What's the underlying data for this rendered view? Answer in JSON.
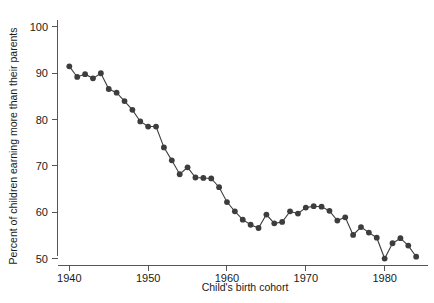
{
  "chart_data": {
    "type": "line",
    "title": "",
    "xlabel": "Child's birth cohort",
    "ylabel": "Percent of children earning more than their parents",
    "xlim": [
      1938.5,
      1985.5
    ],
    "ylim": [
      48.5,
      101.5
    ],
    "xticks": [
      1940,
      1950,
      1960,
      1970,
      1980
    ],
    "yticks": [
      50,
      60,
      70,
      80,
      90,
      100
    ],
    "xtick_labels": [
      "1940",
      "1950",
      "1960",
      "1970",
      "1980"
    ],
    "ytick_labels": [
      "50",
      "60",
      "70",
      "80",
      "90",
      "100"
    ],
    "grid": false,
    "legend": "none",
    "marker": "circle",
    "marker_color": "#3d3d3d",
    "line_color": "#3d3d3d",
    "x": [
      1940,
      1941,
      1942,
      1943,
      1944,
      1945,
      1946,
      1947,
      1948,
      1949,
      1950,
      1951,
      1952,
      1953,
      1954,
      1955,
      1956,
      1957,
      1958,
      1959,
      1960,
      1961,
      1962,
      1963,
      1964,
      1965,
      1966,
      1967,
      1968,
      1969,
      1970,
      1971,
      1972,
      1973,
      1974,
      1975,
      1976,
      1977,
      1978,
      1979,
      1980,
      1981,
      1982,
      1983,
      1984
    ],
    "values": [
      91.5,
      89.2,
      89.8,
      88.9,
      90.0,
      86.6,
      85.8,
      84.0,
      82.1,
      79.6,
      78.5,
      78.5,
      74.0,
      71.2,
      68.2,
      69.7,
      67.5,
      67.4,
      67.3,
      65.4,
      62.2,
      60.2,
      58.4,
      57.3,
      56.6,
      59.5,
      57.6,
      57.9,
      60.2,
      59.7,
      61.0,
      61.3,
      61.2,
      60.3,
      58.2,
      58.9,
      55.1,
      56.8,
      55.6,
      54.5,
      50.0,
      53.3,
      54.4,
      52.8,
      50.4
    ]
  },
  "axes": {
    "x_axis_name": "x-axis",
    "y_axis_name": "y-axis"
  }
}
